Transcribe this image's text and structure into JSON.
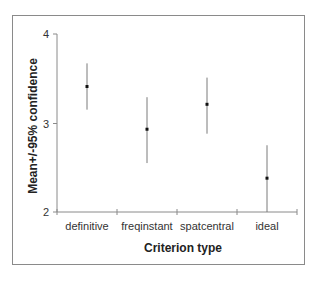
{
  "chart_data": {
    "type": "scatter",
    "subtype": "error-bar",
    "title": "",
    "xlabel": "Criterion type",
    "ylabel": "Mean+/-95% confidence",
    "categories": [
      "definitive",
      "freqinstant",
      "spatcentral",
      "ideal"
    ],
    "series": [
      {
        "name": "Mean",
        "values": [
          3.41,
          2.93,
          3.21,
          2.38
        ],
        "ci_upper": [
          3.67,
          3.29,
          3.51,
          2.75
        ],
        "ci_lower": [
          3.15,
          2.55,
          2.88,
          2.0
        ]
      }
    ],
    "yticks": [
      "2",
      "3",
      "4"
    ],
    "ylim": [
      2,
      4
    ],
    "grid": false,
    "legend": null
  },
  "axis": {
    "y_title": "Mean+/-95% confidence",
    "x_title": "Criterion type",
    "y_ticks": [
      "4",
      "3",
      "2"
    ],
    "categories": [
      "definitive",
      "freqinstant",
      "spatcentral",
      "ideal"
    ]
  },
  "colors": {
    "axis": "#8a8a8a",
    "errorbar": "#7a7a7a",
    "marker": "#111111",
    "frame": "#8a8a8a"
  }
}
